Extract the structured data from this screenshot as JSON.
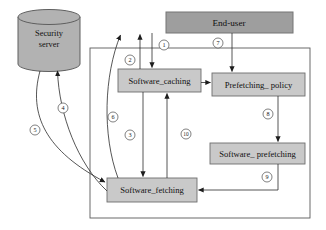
{
  "nodes": {
    "security_server": {
      "line1": "Security",
      "line2": "server"
    },
    "end_user": {
      "label": "End-user"
    },
    "software_caching": {
      "label": "Software_caching"
    },
    "prefetching_policy": {
      "label": "Prefetching_ policy"
    },
    "software_prefetching": {
      "label": "Software_ prefetching"
    },
    "software_fetching": {
      "label": "Software_fetching"
    }
  },
  "steps": {
    "1": "1",
    "2": "2",
    "3": "3",
    "4": "4",
    "5": "5",
    "6": "6",
    "7": "7",
    "8": "8",
    "9": "9",
    "10": "10"
  },
  "colors": {
    "background": "#ffffff",
    "end_user_fill": "#9e9e9e",
    "end_user_border": "#757575",
    "node_fill": "#c9c9c9",
    "node_border": "#6e6e6e",
    "cylinder_fill": "#b2b2b2",
    "cylinder_border": "#5f5f5f",
    "boundary_border": "#5a5a5a",
    "line": "#2b2b2b",
    "step_circle_fill": "#ffffff",
    "step_circle_border": "#4a4a4a"
  }
}
